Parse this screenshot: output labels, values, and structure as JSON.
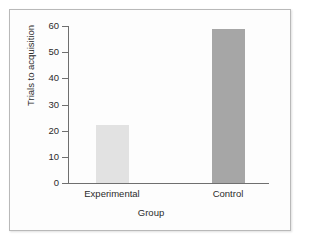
{
  "figure": {
    "background_color": "#fdfdfd",
    "frame_color": "#b9b9b9",
    "axis_color": "#6f6f6f",
    "text_color": "#2b2b2b"
  },
  "chart_data": {
    "type": "bar",
    "title": "",
    "subtitle": "",
    "categories": [
      "Experimental",
      "Control"
    ],
    "values": [
      22,
      59
    ],
    "series": [
      {
        "name": "Trials to acquisition",
        "values": [
          22,
          59
        ],
        "colors": [
          "#e2e2e2",
          "#a6a6a6"
        ]
      }
    ],
    "xlabel": "Group",
    "ylabel": "Trials to acquisition",
    "ylim": [
      0,
      60
    ],
    "yticks": [
      0,
      10,
      20,
      30,
      40,
      50,
      60
    ],
    "ytick_labels": [
      "0",
      "10",
      "20",
      "30",
      "40",
      "50",
      "60"
    ],
    "xtick_labels": [
      "Experimental",
      "Control"
    ],
    "grid": false,
    "legend": false,
    "legend_position": "none",
    "annotations": []
  }
}
